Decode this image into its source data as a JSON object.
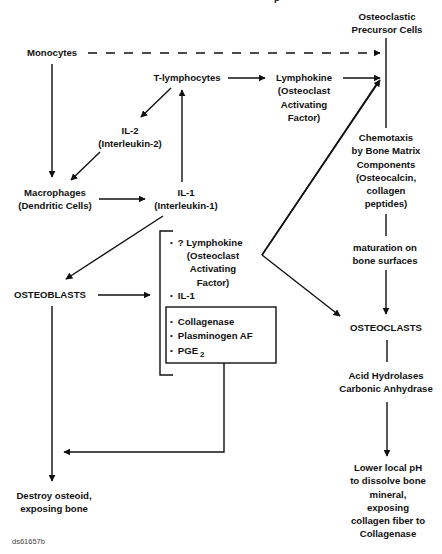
{
  "title_fragment": "p",
  "nodes": {
    "monocytes": "Monocytes",
    "osteoclastic_precursor": [
      "Osteoclastic",
      "Precursor Cells"
    ],
    "t_lymphocytes": "T-lymphocytes",
    "lymphokine": [
      "Lymphokine",
      "(Osteoclast",
      "Activating",
      "Factor)"
    ],
    "il2": [
      "IL-2",
      "(Interleukin-2)"
    ],
    "macrophages": [
      "Macrophages",
      "(Dendritic Cells)"
    ],
    "il1": [
      "IL-1",
      "(Interleukin-1)"
    ],
    "chemotaxis": [
      "Chemotaxis",
      "by Bone Matrix",
      "Components",
      "(Osteocalcin,",
      "collagen",
      "peptides)"
    ],
    "maturation": [
      "maturation on",
      "bone surfaces"
    ],
    "osteoblasts": "OSTEOBLASTS",
    "osteoclasts": "OSTEOCLASTS",
    "acid_hydrolases": [
      "Acid Hydrolases",
      "Carbonic Anhydrase"
    ],
    "lower_ph": [
      "Lower local pH",
      "to dissolve bone",
      "mineral,",
      "exposing",
      "collagen fiber to",
      "Collagenase"
    ],
    "destroy_osteoid": [
      "Destroy osteoid,",
      "exposing bone"
    ]
  },
  "bracket_items": {
    "lymphokine": [
      "? Lymphokine",
      "(Osteoclast",
      "Activating",
      "Factor)"
    ],
    "il1": "IL-1"
  },
  "box_items": {
    "collagenase": "Collagenase",
    "plasminogen": "Plasminogen AF",
    "pge": "PGE",
    "pge_sub": "2"
  },
  "footer_id": "ds61657b",
  "colors": {
    "line": "#111111",
    "background": "#ffffff"
  }
}
